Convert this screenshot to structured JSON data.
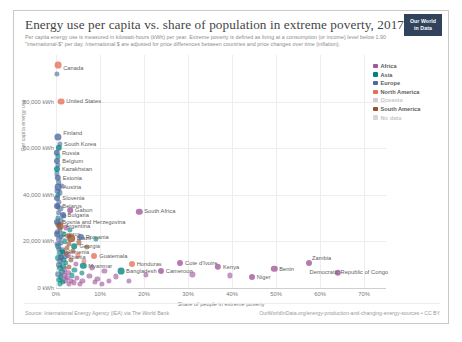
{
  "header": {
    "title": "Energy use per capita vs. share of population in extreme poverty, 2017",
    "subtitle": "Per capita energy use is measured in kilowatt-hours (kWh) per year. Extreme poverty is defined as living at a consumption (or income) level below 1.90 \"international-$\" per day. International $ are adjusted for price differences between countries and price changes over time (inflation).",
    "logo_line1": "Our World",
    "logo_line2": "in Data"
  },
  "legend": {
    "items": [
      {
        "label": "Africa",
        "color": "#a2559c",
        "dim": false
      },
      {
        "label": "Asia",
        "color": "#00847e",
        "dim": false
      },
      {
        "label": "Europe",
        "color": "#4c6a9c",
        "dim": false
      },
      {
        "label": "North America",
        "color": "#e56e5a",
        "dim": false
      },
      {
        "label": "Oceania",
        "color": "#cfcfcf",
        "dim": true
      },
      {
        "label": "South America",
        "color": "#9a5129",
        "dim": false
      },
      {
        "label": "No data",
        "color": "#d6d6d6",
        "dim": true
      }
    ]
  },
  "footer": {
    "source": "Source: International Energy Agency (IEA) via The World Bank",
    "link": "OurWorldInData.org/energy-production-and-changing-energy-sources • CC BY"
  },
  "chart_data": {
    "type": "scatter",
    "title": "Energy use per capita vs. share of population in extreme poverty, 2017",
    "xlabel": "Share of people in extreme poverty",
    "ylabel": "Per capita energy use",
    "xlim": [
      0,
      75
    ],
    "ylim": [
      0,
      100000
    ],
    "xticks": [
      0,
      10,
      20,
      30,
      40,
      50,
      60,
      70
    ],
    "xticklabels": [
      "0%",
      "10%",
      "20%",
      "30%",
      "40%",
      "50%",
      "60%",
      "70%"
    ],
    "yticks": [
      0,
      20000,
      40000,
      60000,
      80000
    ],
    "yticklabels": [
      "0 kWh",
      "20,000 kWh",
      "40,000 kWh",
      "60,000 kWh",
      "80,000 kWh"
    ],
    "grid": true,
    "legend_position": "right",
    "points": [
      {
        "name": "Canada",
        "x": 0.5,
        "y": 95500,
        "color": "#e56e5a",
        "r": 3.4,
        "label_dx": 5,
        "label_dy": 3
      },
      {
        "name": "United States",
        "x": 1.2,
        "y": 80000,
        "color": "#e56e5a",
        "r": 3.4,
        "label_dx": 5,
        "label_dy": -1
      },
      {
        "name": "Finland",
        "x": 0.5,
        "y": 64800,
        "color": "#4c6a9c",
        "r": 3.6,
        "label_dx": 5,
        "label_dy": -4
      },
      {
        "name": "South Korea",
        "x": 0.7,
        "y": 60200,
        "color": "#00847e",
        "r": 3.2,
        "label_dx": 5,
        "label_dy": -4
      },
      {
        "name": "Russia",
        "x": 0.2,
        "y": 58000,
        "color": "#4c6a9c",
        "r": 3.2,
        "label_dx": 5,
        "label_dy": 0
      },
      {
        "name": "Belgium",
        "x": 0.3,
        "y": 54600,
        "color": "#4c6a9c",
        "r": 3.0,
        "label_dx": 5,
        "label_dy": 0
      },
      {
        "name": "Kazakhstan",
        "x": 0.2,
        "y": 51000,
        "color": "#00847e",
        "r": 3.0,
        "label_dx": 5,
        "label_dy": 0
      },
      {
        "name": "Estonia",
        "x": 0.4,
        "y": 47400,
        "color": "#4c6a9c",
        "r": 3.2,
        "label_dx": 5,
        "label_dy": 0
      },
      {
        "name": "Austria",
        "x": 0.5,
        "y": 43300,
        "color": "#4c6a9c",
        "r": 3.4,
        "label_dx": 5,
        "label_dy": 0
      },
      {
        "name": "Slovenia",
        "x": 0.3,
        "y": 38600,
        "color": "#4c6a9c",
        "r": 3.0,
        "label_dx": 5,
        "label_dy": 0
      },
      {
        "name": "Belarus",
        "x": 0.3,
        "y": 35400,
        "color": "#4c6a9c",
        "r": 3.0,
        "label_dx": 5,
        "label_dy": 0
      },
      {
        "name": "Gabon",
        "x": 3.2,
        "y": 33500,
        "color": "#a2559c",
        "r": 2.8,
        "label_dx": 5,
        "label_dy": 0
      },
      {
        "name": "South Africa",
        "x": 18.9,
        "y": 32700,
        "color": "#a2559c",
        "r": 3.2,
        "label_dx": 5,
        "label_dy": -1
      },
      {
        "name": "Bulgaria",
        "x": 1.5,
        "y": 31500,
        "color": "#4c6a9c",
        "r": 3.0,
        "label_dx": 5,
        "label_dy": 0
      },
      {
        "name": "Bosnia and Herzegovina",
        "x": 0.3,
        "y": 28500,
        "color": "#4c6a9c",
        "r": 3.0,
        "label_dx": 5,
        "label_dy": 0
      },
      {
        "name": "Argentina",
        "x": 1.0,
        "y": 26700,
        "color": "#9a5129",
        "r": 3.4,
        "label_dx": 5,
        "label_dy": 0
      },
      {
        "name": "Cyprus",
        "x": 0.3,
        "y": 23200,
        "color": "#4c6a9c",
        "r": 2.8,
        "label_dx": 5,
        "label_dy": 0
      },
      {
        "name": "Brazil",
        "x": 3.5,
        "y": 21400,
        "color": "#9a5129",
        "r": 3.8,
        "label_dx": 5,
        "label_dy": 0
      },
      {
        "name": "Romania",
        "x": 5.6,
        "y": 21800,
        "color": "#4c6a9c",
        "r": 3.0,
        "label_dx": 5,
        "label_dy": 0
      },
      {
        "name": "Georgia",
        "x": 4.2,
        "y": 17900,
        "color": "#00847e",
        "r": 2.8,
        "label_dx": 5,
        "label_dy": 0
      },
      {
        "name": "Armenia",
        "x": 1.5,
        "y": 15600,
        "color": "#00847e",
        "r": 2.8,
        "label_dx": 5,
        "label_dy": 0
      },
      {
        "name": "Albania",
        "x": 1.2,
        "y": 13200,
        "color": "#4c6a9c",
        "r": 3.0,
        "label_dx": 5,
        "label_dy": 0
      },
      {
        "name": "Guatemala",
        "x": 8.7,
        "y": 13800,
        "color": "#e56e5a",
        "r": 3.0,
        "label_dx": 5,
        "label_dy": 0
      },
      {
        "name": "Myanmar",
        "x": 6.2,
        "y": 9500,
        "color": "#00847e",
        "r": 3.2,
        "label_dx": 5,
        "label_dy": 0
      },
      {
        "name": "Honduras",
        "x": 17.2,
        "y": 10500,
        "color": "#e56e5a",
        "r": 3.0,
        "label_dx": 5,
        "label_dy": 0
      },
      {
        "name": "Bangladesh",
        "x": 14.8,
        "y": 7200,
        "color": "#00847e",
        "r": 3.4,
        "label_dx": 5,
        "label_dy": 0
      },
      {
        "name": "Cameroon",
        "x": 23.8,
        "y": 7400,
        "color": "#a2559c",
        "r": 3.0,
        "label_dx": 5,
        "label_dy": 0
      },
      {
        "name": "Cote d'Ivoire",
        "x": 28.2,
        "y": 10600,
        "color": "#a2559c",
        "r": 3.0,
        "label_dx": 5,
        "label_dy": 0
      },
      {
        "name": "Kenya",
        "x": 36.8,
        "y": 9100,
        "color": "#a2559c",
        "r": 3.2,
        "label_dx": 5,
        "label_dy": 0
      },
      {
        "name": "Niger",
        "x": 44.5,
        "y": 4700,
        "color": "#a2559c",
        "r": 3.0,
        "label_dx": 5,
        "label_dy": 0
      },
      {
        "name": "Benin",
        "x": 49.6,
        "y": 8300,
        "color": "#a2559c",
        "r": 3.2,
        "label_dx": 5,
        "label_dy": 0
      },
      {
        "name": "Zambia",
        "x": 57.5,
        "y": 10800,
        "color": "#a2559c",
        "r": 3.0,
        "label_dx": 3,
        "label_dy": -5
      },
      {
        "name": "Democratic Republic of Congo",
        "x": 64.0,
        "y": 6400,
        "color": "#a2559c",
        "r": 3.2,
        "label_dx": -28,
        "label_dy": -1
      }
    ],
    "unlabeled_points": [
      {
        "x": 0.2,
        "y": 92000,
        "color": "#4c6a9c",
        "r": 2.6
      },
      {
        "x": 0.4,
        "y": 56500,
        "color": "#00847e",
        "r": 2.6
      },
      {
        "x": 0.5,
        "y": 52800,
        "color": "#4c6a9c",
        "r": 2.6
      },
      {
        "x": 0.2,
        "y": 49200,
        "color": "#4c6a9c",
        "r": 2.6
      },
      {
        "x": 0.6,
        "y": 45500,
        "color": "#4c6a9c",
        "r": 2.8
      },
      {
        "x": 0.3,
        "y": 41800,
        "color": "#4c6a9c",
        "r": 2.6
      },
      {
        "x": 0.8,
        "y": 41000,
        "color": "#4c6a9c",
        "r": 2.6
      },
      {
        "x": 0.4,
        "y": 40000,
        "color": "#00847e",
        "r": 2.6
      },
      {
        "x": 0.6,
        "y": 37000,
        "color": "#4c6a9c",
        "r": 2.6
      },
      {
        "x": 1.0,
        "y": 34200,
        "color": "#4c6a9c",
        "r": 2.6
      },
      {
        "x": 0.6,
        "y": 32400,
        "color": "#4c6a9c",
        "r": 2.8
      },
      {
        "x": 1.8,
        "y": 30800,
        "color": "#4c6a9c",
        "r": 2.6
      },
      {
        "x": 0.4,
        "y": 30000,
        "color": "#00847e",
        "r": 2.6
      },
      {
        "x": 1.2,
        "y": 29000,
        "color": "#4c6a9c",
        "r": 2.6
      },
      {
        "x": 0.5,
        "y": 27500,
        "color": "#4c6a9c",
        "r": 2.8
      },
      {
        "x": 2.2,
        "y": 26000,
        "color": "#a2559c",
        "r": 2.6
      },
      {
        "x": 0.9,
        "y": 25000,
        "color": "#4c6a9c",
        "r": 2.6
      },
      {
        "x": 0.3,
        "y": 24200,
        "color": "#4c6a9c",
        "r": 2.6
      },
      {
        "x": 1.6,
        "y": 23000,
        "color": "#00847e",
        "r": 2.8
      },
      {
        "x": 2.8,
        "y": 22400,
        "color": "#9a5129",
        "r": 2.6
      },
      {
        "x": 0.7,
        "y": 21000,
        "color": "#4c6a9c",
        "r": 3.0
      },
      {
        "x": 2.0,
        "y": 20200,
        "color": "#00847e",
        "r": 2.8
      },
      {
        "x": 1.1,
        "y": 19400,
        "color": "#4c6a9c",
        "r": 2.6
      },
      {
        "x": 3.0,
        "y": 18800,
        "color": "#9a5129",
        "r": 2.6
      },
      {
        "x": 0.5,
        "y": 18000,
        "color": "#00847e",
        "r": 2.8
      },
      {
        "x": 2.4,
        "y": 17200,
        "color": "#9a5129",
        "r": 2.6
      },
      {
        "x": 1.4,
        "y": 16400,
        "color": "#4c6a9c",
        "r": 2.8
      },
      {
        "x": 3.8,
        "y": 16000,
        "color": "#9a5129",
        "r": 2.6
      },
      {
        "x": 0.8,
        "y": 15000,
        "color": "#00847e",
        "r": 3.0
      },
      {
        "x": 2.6,
        "y": 14400,
        "color": "#a2559c",
        "r": 2.6
      },
      {
        "x": 5.0,
        "y": 14000,
        "color": "#e56e5a",
        "r": 2.6
      },
      {
        "x": 1.8,
        "y": 13400,
        "color": "#4c6a9c",
        "r": 2.8
      },
      {
        "x": 0.4,
        "y": 12800,
        "color": "#00847e",
        "r": 3.0
      },
      {
        "x": 3.4,
        "y": 12200,
        "color": "#9a5129",
        "r": 2.6
      },
      {
        "x": 6.4,
        "y": 11800,
        "color": "#e56e5a",
        "r": 2.6
      },
      {
        "x": 1.0,
        "y": 11400,
        "color": "#4c6a9c",
        "r": 2.8
      },
      {
        "x": 2.2,
        "y": 10800,
        "color": "#00847e",
        "r": 2.8
      },
      {
        "x": 4.6,
        "y": 10400,
        "color": "#a2559c",
        "r": 2.6
      },
      {
        "x": 0.6,
        "y": 10000,
        "color": "#4c6a9c",
        "r": 3.0
      },
      {
        "x": 1.6,
        "y": 9400,
        "color": "#00847e",
        "r": 2.8
      },
      {
        "x": 3.0,
        "y": 9000,
        "color": "#9a5129",
        "r": 2.6
      },
      {
        "x": 8.2,
        "y": 8800,
        "color": "#a2559c",
        "r": 2.6
      },
      {
        "x": 0.9,
        "y": 8400,
        "color": "#00847e",
        "r": 3.0
      },
      {
        "x": 2.0,
        "y": 8000,
        "color": "#a2559c",
        "r": 2.8
      },
      {
        "x": 4.2,
        "y": 7600,
        "color": "#00847e",
        "r": 2.6
      },
      {
        "x": 11.0,
        "y": 7400,
        "color": "#a2559c",
        "r": 2.6
      },
      {
        "x": 1.3,
        "y": 7000,
        "color": "#00847e",
        "r": 3.0
      },
      {
        "x": 2.8,
        "y": 6600,
        "color": "#a2559c",
        "r": 2.8
      },
      {
        "x": 5.8,
        "y": 6400,
        "color": "#00847e",
        "r": 2.6
      },
      {
        "x": 0.5,
        "y": 6000,
        "color": "#4c6a9c",
        "r": 2.8
      },
      {
        "x": 1.9,
        "y": 5600,
        "color": "#a2559c",
        "r": 2.8
      },
      {
        "x": 3.6,
        "y": 5400,
        "color": "#00847e",
        "r": 2.6
      },
      {
        "x": 7.6,
        "y": 5200,
        "color": "#a2559c",
        "r": 2.6
      },
      {
        "x": 13.6,
        "y": 5000,
        "color": "#a2559c",
        "r": 2.6
      },
      {
        "x": 1.1,
        "y": 4600,
        "color": "#00847e",
        "r": 2.8
      },
      {
        "x": 2.5,
        "y": 4400,
        "color": "#a2559c",
        "r": 2.8
      },
      {
        "x": 4.8,
        "y": 4200,
        "color": "#a2559c",
        "r": 2.6
      },
      {
        "x": 9.4,
        "y": 4000,
        "color": "#a2559c",
        "r": 2.6
      },
      {
        "x": 20.4,
        "y": 5600,
        "color": "#a2559c",
        "r": 2.6
      },
      {
        "x": 0.7,
        "y": 3600,
        "color": "#00847e",
        "r": 2.8
      },
      {
        "x": 2.1,
        "y": 3400,
        "color": "#a2559c",
        "r": 2.8
      },
      {
        "x": 3.3,
        "y": 3200,
        "color": "#a2559c",
        "r": 2.6
      },
      {
        "x": 6.0,
        "y": 3000,
        "color": "#a2559c",
        "r": 2.6
      },
      {
        "x": 12.0,
        "y": 3200,
        "color": "#a2559c",
        "r": 2.6
      },
      {
        "x": 31.0,
        "y": 5800,
        "color": "#a2559c",
        "r": 2.6
      },
      {
        "x": 39.5,
        "y": 5400,
        "color": "#a2559c",
        "r": 2.6
      },
      {
        "x": 1.5,
        "y": 2600,
        "color": "#00847e",
        "r": 2.6
      },
      {
        "x": 4.0,
        "y": 2400,
        "color": "#a2559c",
        "r": 2.6
      },
      {
        "x": 8.8,
        "y": 2600,
        "color": "#a2559c",
        "r": 2.6
      },
      {
        "x": 16.5,
        "y": 3000,
        "color": "#a2559c",
        "r": 2.6
      },
      {
        "x": 0.8,
        "y": 2000,
        "color": "#00847e",
        "r": 2.6
      },
      {
        "x": 2.9,
        "y": 1800,
        "color": "#a2559c",
        "r": 2.6
      },
      {
        "x": 5.4,
        "y": 1600,
        "color": "#a2559c",
        "r": 2.6
      },
      {
        "x": 10.5,
        "y": 1800,
        "color": "#a2559c",
        "r": 2.6
      },
      {
        "x": 1.2,
        "y": 21800,
        "color": "#4c6a9c",
        "r": 2.6
      },
      {
        "x": 0.3,
        "y": 19000,
        "color": "#4c6a9c",
        "r": 2.6
      },
      {
        "x": 1.7,
        "y": 12000,
        "color": "#00847e",
        "r": 2.6
      },
      {
        "x": 0.6,
        "y": 16800,
        "color": "#4c6a9c",
        "r": 2.6
      },
      {
        "x": 2.3,
        "y": 15200,
        "color": "#9a5129",
        "r": 2.6
      },
      {
        "x": 3.2,
        "y": 24800,
        "color": "#00847e",
        "r": 2.6
      },
      {
        "x": 0.4,
        "y": 35000,
        "color": "#4c6a9c",
        "r": 2.6
      },
      {
        "x": 1.4,
        "y": 43800,
        "color": "#4c6a9c",
        "r": 2.6
      },
      {
        "x": 0.9,
        "y": 62000,
        "color": "#4c6a9c",
        "r": 2.6
      },
      {
        "x": 7.0,
        "y": 17600,
        "color": "#9a5129",
        "r": 2.6
      },
      {
        "x": 5.2,
        "y": 19600,
        "color": "#9a5129",
        "r": 2.6
      },
      {
        "x": 9.0,
        "y": 21000,
        "color": "#00847e",
        "r": 2.6
      }
    ]
  }
}
